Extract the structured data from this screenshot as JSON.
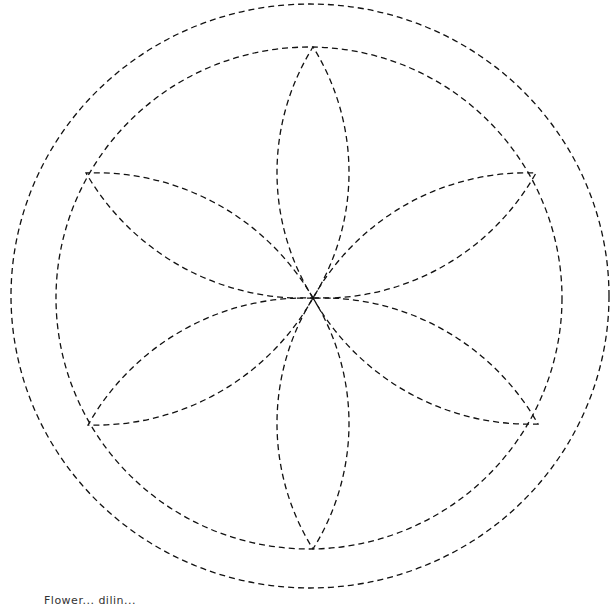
{
  "diagram": {
    "stroke_color": "#111111",
    "stroke_width": 1.3,
    "dash_pattern": "6,4",
    "center": {
      "x": 313,
      "y": 298
    },
    "outer_circle": {
      "cx": 310,
      "cy": 296,
      "rx": 299,
      "ry": 292
    },
    "inner_circle": {
      "cx": 309,
      "cy": 298,
      "rx": 253,
      "ry": 251
    },
    "petal_count": 6,
    "petal_half_width": 36,
    "petal_tips": [
      {
        "name": "top",
        "x": 313,
        "y": 47
      },
      {
        "name": "upper-right",
        "x": 536,
        "y": 173
      },
      {
        "name": "lower-right",
        "x": 538,
        "y": 424
      },
      {
        "name": "bottom",
        "x": 313,
        "y": 549
      },
      {
        "name": "lower-left",
        "x": 88,
        "y": 425
      },
      {
        "name": "upper-left",
        "x": 86,
        "y": 173
      }
    ]
  },
  "caption": {
    "text": "Flower... dilin..."
  }
}
